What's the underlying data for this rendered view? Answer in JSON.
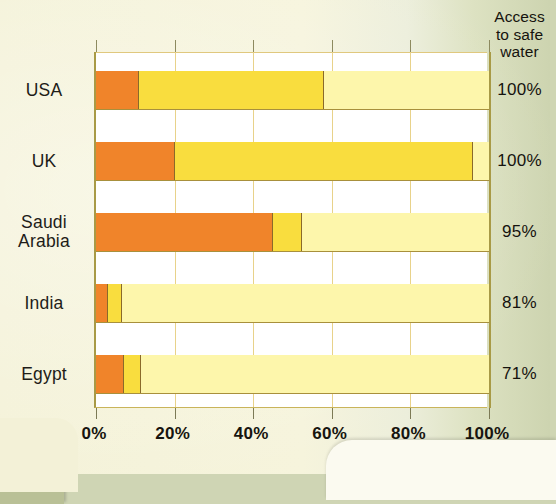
{
  "chart_data": {
    "type": "bar",
    "orientation": "horizontal",
    "stacked": true,
    "title": "",
    "xlabel": "",
    "ylabel": "",
    "xlim": [
      0,
      100
    ],
    "xticks": [
      0,
      20,
      40,
      60,
      80,
      100
    ],
    "xticklabels": [
      "0%",
      "20%",
      "40%",
      "60%",
      "80%",
      "100%"
    ],
    "grid": true,
    "categories": [
      "USA",
      "UK",
      "Saudi Arabia",
      "India",
      "Egypt"
    ],
    "series": [
      {
        "name": "segment-1",
        "color": "#f0842a",
        "values": [
          11,
          20,
          45,
          3,
          7
        ]
      },
      {
        "name": "segment-2",
        "color": "#f9dd3e",
        "values": [
          47,
          76,
          7.5,
          3.5,
          4.5
        ]
      },
      {
        "name": "segment-3",
        "color": "#fdf6ab",
        "values": [
          42,
          4,
          47.5,
          93.5,
          88.5
        ]
      }
    ],
    "annotation_column": {
      "title": "Access to safe water",
      "title_lines": [
        "Access",
        "to safe",
        "water"
      ],
      "values": [
        "100%",
        "100%",
        "95%",
        "81%",
        "71%"
      ]
    }
  },
  "rows": [
    {
      "label": "USA",
      "label_lines": [
        "USA"
      ],
      "access": "100%"
    },
    {
      "label": "UK",
      "label_lines": [
        "UK"
      ],
      "access": "100%"
    },
    {
      "label": "Saudi Arabia",
      "label_lines": [
        "Saudi",
        "Arabia"
      ],
      "access": "95%"
    },
    {
      "label": "India",
      "label_lines": [
        "India"
      ],
      "access": "81%"
    },
    {
      "label": "Egypt",
      "label_lines": [
        "Egypt"
      ],
      "access": "71%"
    }
  ],
  "axis": {
    "ticks": [
      "0%",
      "20%",
      "40%",
      "60%",
      "80%",
      "100%"
    ]
  },
  "legend_header": {
    "line1": "Access",
    "line2": "to safe",
    "line3": "water"
  },
  "colors": {
    "segment_1": "#f0842a",
    "segment_2": "#f9dd3e",
    "segment_3": "#fdf6ab",
    "page_background": "#f4f2d8",
    "plot_background": "#ffffff",
    "grid": "#e8d28a",
    "axis": "#a89a46"
  }
}
